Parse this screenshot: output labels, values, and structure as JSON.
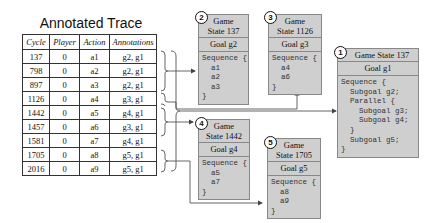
{
  "title": "Annotated Trace",
  "table": {
    "headers": [
      "Cycle",
      "Player",
      "Action",
      "Annotations"
    ],
    "rows": [
      [
        "137",
        "0",
        "a1",
        "g2, g1"
      ],
      [
        "798",
        "0",
        "a2",
        "g2, g1"
      ],
      [
        "897",
        "0",
        "a3",
        "g2, g1"
      ],
      [
        "1126",
        "0",
        "a4",
        "g3, g1"
      ],
      [
        "1442",
        "0",
        "a5",
        "g4, g1"
      ],
      [
        "1457",
        "0",
        "a6",
        "g3, g1"
      ],
      [
        "1581",
        "0",
        "a7",
        "g4, g1"
      ],
      [
        "1705",
        "0",
        "a8",
        "g5, g1"
      ],
      [
        "2016",
        "0",
        "a9",
        "g5, g1"
      ]
    ]
  },
  "boxes": [
    {
      "id": "1",
      "header": "Game State 137",
      "goal": "Goal g1",
      "body": "Sequence {\n  Subgoal g2;\n  Parallel {\n    Subgoal g3;\n    Subgoal g4;\n  }\n  Subgoal g5;\n}"
    },
    {
      "id": "2",
      "header_line1": "Game",
      "header_line2": "State 137",
      "goal": "Goal g2",
      "body": "Sequence {\n  a1\n  a2\n  a3\n}"
    },
    {
      "id": "3",
      "header_line1": "Game",
      "header_line2": "State 1126",
      "goal": "Goal g3",
      "body": "Sequence {\n  a4\n  a6\n}"
    },
    {
      "id": "4",
      "header_line1": "Game",
      "header_line2": "State 1442",
      "goal": "Goal g4",
      "body": "Sequence {\n  a5\n  a7\n}"
    },
    {
      "id": "5",
      "header_line1": "Game",
      "header_line2": "State 1705",
      "goal": "Goal g5",
      "body": "Sequence {\n  a8\n  a9\n}"
    }
  ],
  "colors": {
    "box_fill": "#cfcfcf",
    "box_border": "#888888",
    "line": "#555555"
  }
}
